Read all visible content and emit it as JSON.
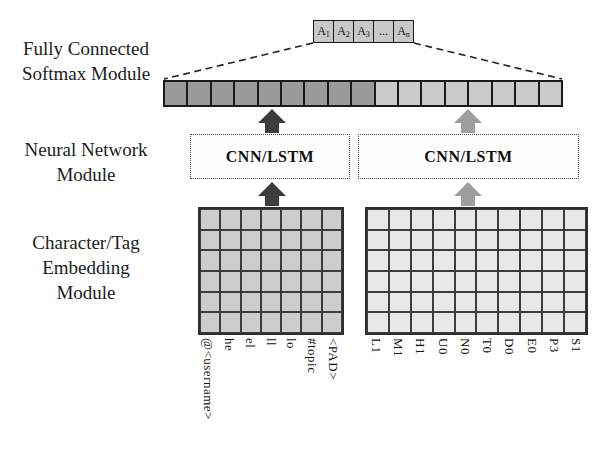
{
  "module_labels": {
    "softmax": [
      "Fully Connected",
      "Softmax Module"
    ],
    "neural": [
      "Neural Network",
      "Module"
    ],
    "embedding": [
      "Character/Tag",
      "Embedding",
      "Module"
    ]
  },
  "softmax_output_cells": [
    {
      "t": "A",
      "s": "1"
    },
    {
      "t": "A",
      "s": "2"
    },
    {
      "t": "A",
      "s": "3"
    },
    {
      "t": "...",
      "s": ""
    },
    {
      "t": "A",
      "s": "n"
    }
  ],
  "concat_bar": {
    "dark_count": 9,
    "light_count": 8
  },
  "cnn_boxes": {
    "left": "CNN/LSTM",
    "right": "CNN/LSTM"
  },
  "grids": {
    "left": {
      "cols": 7,
      "rows": 6,
      "column_labels": [
        "@<username>",
        "he",
        "el",
        "ll",
        "lo",
        "#topic",
        "<PAD>"
      ]
    },
    "right": {
      "cols": 10,
      "rows": 6,
      "column_labels": [
        "L1",
        "M1",
        "H1",
        "U0",
        "N0",
        "T0",
        "D0",
        "E0",
        "P3",
        "S1"
      ]
    }
  },
  "colors": {
    "dark_arrow": "#3c3c3c",
    "gray_arrow": "#9e9e9e",
    "bar_dark": "#9a9a9a",
    "bar_light": "#cbcbcb",
    "left_grid_fill": "#cdcdcd",
    "right_grid_fill": "#e8e8e8",
    "dash_line": "#222222"
  }
}
